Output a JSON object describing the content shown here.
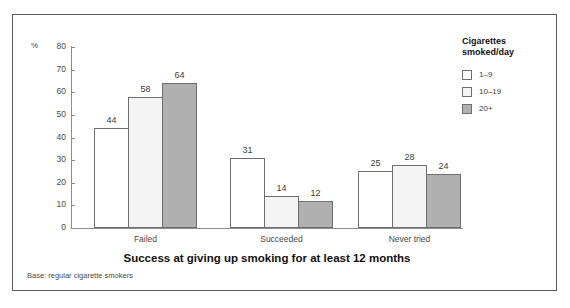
{
  "chart_data": {
    "type": "bar",
    "title": "Success at giving up smoking for at least 12 months",
    "xlabel": "",
    "ylabel": "%",
    "ylim": [
      0,
      80
    ],
    "yticks": [
      0,
      10,
      20,
      30,
      40,
      50,
      60,
      70,
      80
    ],
    "grid": false,
    "legend_position": "right",
    "legend_title": "Cigarettes\nsmoked/day",
    "categories": [
      "Failed",
      "Succeeded",
      "Never tried"
    ],
    "series": [
      {
        "name": "1–9",
        "values": [
          44,
          31,
          25
        ],
        "color": "#ffffff"
      },
      {
        "name": "10–19",
        "values": [
          58,
          14,
          28
        ],
        "color": "#f4f4f4"
      },
      {
        "name": "20+",
        "values": [
          64,
          12,
          24
        ],
        "color": "#b0b0b0"
      }
    ],
    "base_note": "Base: regular cigarette smokers"
  },
  "axis": {
    "percent_symbol": "%",
    "tick_labels": [
      "80",
      "70",
      "60",
      "50",
      "40",
      "30",
      "20",
      "10",
      "0"
    ]
  },
  "legend": {
    "title": "Cigarettes\nsmoked/day",
    "items": [
      {
        "label": "1–9"
      },
      {
        "label": "10–19"
      },
      {
        "label": "20+"
      }
    ]
  },
  "footer": {
    "base_note": "Base: regular cigarette smokers"
  }
}
